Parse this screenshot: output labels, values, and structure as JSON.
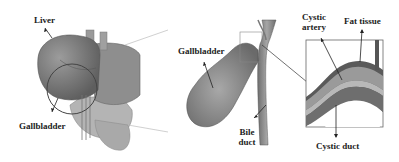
{
  "diagram": {
    "panels": [
      {
        "id": "anatomy-overview",
        "description": "Liver and surrounding organs with gallbladder region circled"
      },
      {
        "id": "gallbladder-detail",
        "description": "Gallbladder with bile duct and zoom box"
      },
      {
        "id": "cystic-cross-section",
        "description": "Zoomed section showing cystic artery, fat tissue and cystic duct layers"
      }
    ],
    "labels": {
      "liver": "Liver",
      "gallbladder_left": "Gallbladder",
      "gallbladder_middle": "Gallbladder",
      "bile_duct_line1": "Bile",
      "bile_duct_line2": "duct",
      "cystic_artery_line1": "Cystic",
      "cystic_artery_line2": "artery",
      "fat_tissue": "Fat tissue",
      "cystic_duct": "Cystic duct"
    },
    "colors": {
      "organ_dark": "#6f6f6f",
      "organ_mid": "#9a9a9a",
      "organ_light": "#c4c4c4",
      "line": "#333333",
      "callout_line": "#b8b8b8"
    }
  }
}
